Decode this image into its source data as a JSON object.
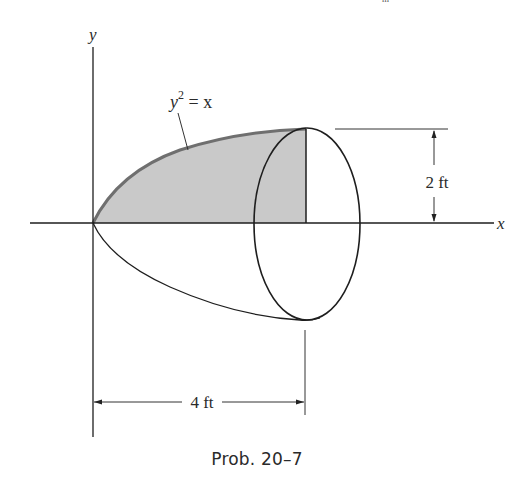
{
  "figure": {
    "caption": "Prob. 20–7",
    "top_fragment": "m",
    "axes": {
      "x_label": "x",
      "y_label": "y"
    },
    "curve": {
      "equation_base": "y",
      "equation_exponent": "2",
      "equation_rest": " = x",
      "equation_full": "y² = x"
    },
    "dimensions": {
      "height": "2 ft",
      "length": "4 ft"
    },
    "colors": {
      "line": "#1e1e1e",
      "shade": "#c9c9c9",
      "shade_edge": "#777777",
      "text": "#2a2a2a",
      "background": "#ffffff"
    }
  }
}
